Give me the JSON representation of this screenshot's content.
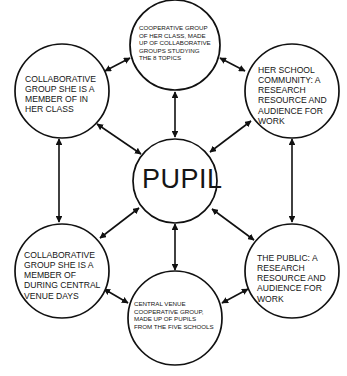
{
  "diagram": {
    "center_node": {
      "label": "PUPIL"
    },
    "nodes": [
      {
        "id": "top",
        "label": "COOPERATIVE GROUP\nOF HER CLASS, MADE\nUP OF COLLABORATIVE\nGROUPS STUDYING\nTHE 8 TOPICS"
      },
      {
        "id": "upper-left",
        "label": "COLLABORATIVE\nGROUP SHE IS A\nMEMBER OF IN\nHER CLASS"
      },
      {
        "id": "upper-right",
        "label": "HER SCHOOL\nCOMMUNITY: A\nRESEARCH\nRESOURCE AND\nAUDIENCE FOR\nWORK"
      },
      {
        "id": "lower-left",
        "label": "COLLABORATIVE\nGROUP SHE IS A\nMEMBER OF\nDURING CENTRAL\nVENUE DAYS"
      },
      {
        "id": "lower-right",
        "label": "THE PUBLIC: A\nRESEARCH\nRESOURCE AND\nAUDIENCE FOR\nWORK"
      },
      {
        "id": "bottom",
        "label": "CENTRAL VENUE\nCOOPERATIVE GROUP,\nMADE UP OF PUPILS\nFROM THE FIVE SCHOOLS"
      }
    ],
    "edges": [
      {
        "from": "PUPIL",
        "to": "top",
        "type": "bidirectional"
      },
      {
        "from": "PUPIL",
        "to": "upper-left",
        "type": "bidirectional"
      },
      {
        "from": "PUPIL",
        "to": "upper-right",
        "type": "bidirectional"
      },
      {
        "from": "PUPIL",
        "to": "lower-left",
        "type": "bidirectional"
      },
      {
        "from": "PUPIL",
        "to": "lower-right",
        "type": "bidirectional"
      },
      {
        "from": "PUPIL",
        "to": "bottom",
        "type": "bidirectional"
      },
      {
        "from": "upper-left",
        "to": "top",
        "type": "bidirectional"
      },
      {
        "from": "top",
        "to": "upper-right",
        "type": "bidirectional"
      },
      {
        "from": "upper-right",
        "to": "lower-right",
        "type": "bidirectional"
      },
      {
        "from": "lower-right",
        "to": "bottom",
        "type": "bidirectional"
      },
      {
        "from": "bottom",
        "to": "lower-left",
        "type": "bidirectional"
      },
      {
        "from": "lower-left",
        "to": "upper-left",
        "type": "bidirectional"
      }
    ],
    "colors": {
      "stroke": "#111111",
      "background": "#ffffff"
    }
  }
}
